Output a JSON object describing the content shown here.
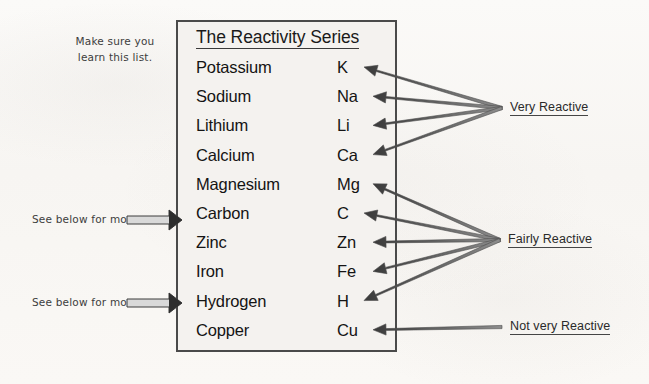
{
  "document": {
    "title": "The Reactivity Series",
    "background_color": "#fbfaf8",
    "box_fill_color": "#f4f2ef",
    "box_border_color": "#4a4a4a",
    "text_color": "#141414"
  },
  "series": {
    "heading": "The Reactivity Series",
    "elements": [
      {
        "name": "Potassium",
        "symbol": "K",
        "category": "Very Reactive"
      },
      {
        "name": "Sodium",
        "symbol": "Na",
        "category": "Very Reactive"
      },
      {
        "name": "Lithium",
        "symbol": "Li",
        "category": "Very Reactive"
      },
      {
        "name": "Calcium",
        "symbol": "Ca",
        "category": "Very Reactive"
      },
      {
        "name": "Magnesium",
        "symbol": "Mg",
        "category": "Fairly Reactive"
      },
      {
        "name": "Carbon",
        "symbol": "C",
        "category": "Fairly Reactive"
      },
      {
        "name": "Zinc",
        "symbol": "Zn",
        "category": "Fairly Reactive"
      },
      {
        "name": "Iron",
        "symbol": "Fe",
        "category": "Fairly Reactive"
      },
      {
        "name": "Hydrogen",
        "symbol": "H",
        "category": "Fairly Reactive"
      },
      {
        "name": "Copper",
        "symbol": "Cu",
        "category": "Not very Reactive"
      }
    ]
  },
  "categories": [
    {
      "label": "Very Reactive",
      "anchor_x": 502,
      "anchor_y": 108
    },
    {
      "label": "Fairly Reactive",
      "anchor_x": 500,
      "anchor_y": 240
    },
    {
      "label": "Not very Reactive",
      "anchor_x": 502,
      "anchor_y": 327
    }
  ],
  "notes": {
    "learn_line_1": "Make sure you",
    "learn_line_2": "learn this list.",
    "see_below_1": "See below for more.",
    "see_below_2": "See below for more."
  }
}
